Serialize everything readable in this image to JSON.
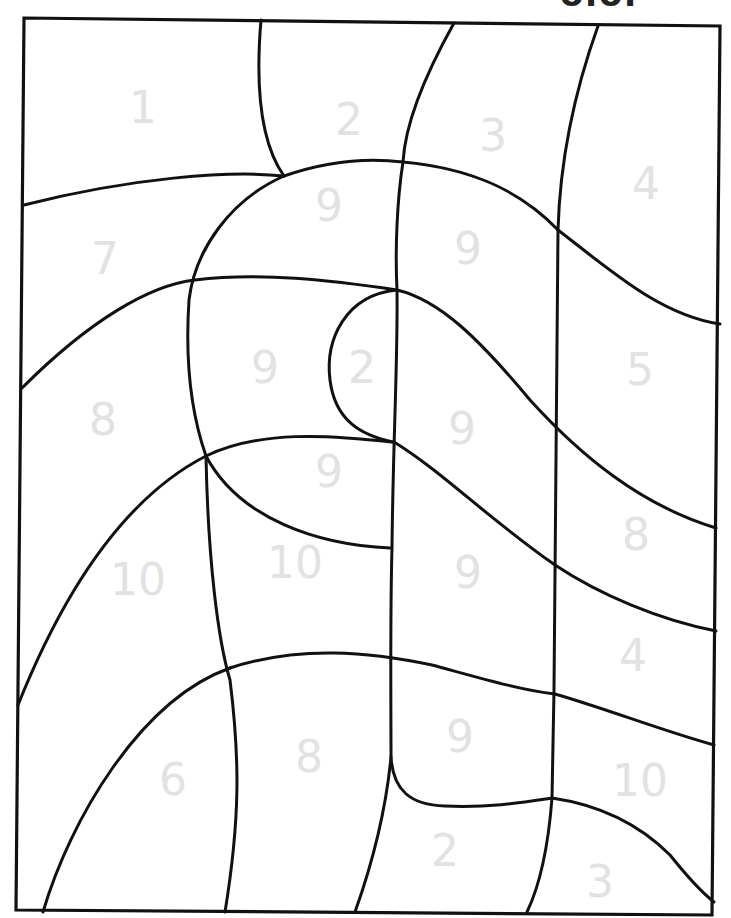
{
  "worksheet": {
    "header_fragment": "olor",
    "line_color": "#111111",
    "number_color": "#e2e2e2",
    "regions": [
      {
        "label": "1",
        "x": 143,
        "y": 108
      },
      {
        "label": "2",
        "x": 349,
        "y": 120
      },
      {
        "label": "3",
        "x": 493,
        "y": 136
      },
      {
        "label": "4",
        "x": 646,
        "y": 184
      },
      {
        "label": "9",
        "x": 329,
        "y": 206
      },
      {
        "label": "7",
        "x": 105,
        "y": 259
      },
      {
        "label": "9",
        "x": 468,
        "y": 249
      },
      {
        "label": "9",
        "x": 265,
        "y": 368
      },
      {
        "label": "2",
        "x": 362,
        "y": 368
      },
      {
        "label": "5",
        "x": 640,
        "y": 370
      },
      {
        "label": "8",
        "x": 103,
        "y": 420
      },
      {
        "label": "9",
        "x": 462,
        "y": 429
      },
      {
        "label": "9",
        "x": 329,
        "y": 472
      },
      {
        "label": "8",
        "x": 636,
        "y": 535
      },
      {
        "label": "9",
        "x": 468,
        "y": 573
      },
      {
        "label": "10",
        "x": 138,
        "y": 580
      },
      {
        "label": "10",
        "x": 295,
        "y": 563
      },
      {
        "label": "4",
        "x": 633,
        "y": 656
      },
      {
        "label": "9",
        "x": 460,
        "y": 737
      },
      {
        "label": "8",
        "x": 309,
        "y": 757
      },
      {
        "label": "6",
        "x": 173,
        "y": 780
      },
      {
        "label": "10",
        "x": 640,
        "y": 781
      },
      {
        "label": "2",
        "x": 445,
        "y": 851
      },
      {
        "label": "3",
        "x": 600,
        "y": 882
      }
    ]
  }
}
